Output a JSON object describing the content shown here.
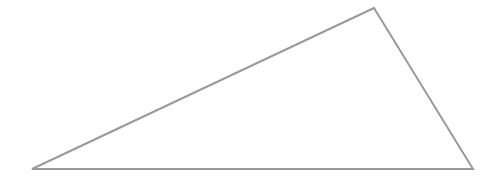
{
  "diagram": {
    "shape": "triangle",
    "vertices": [
      {
        "name": "top",
        "x": 374,
        "y": 8
      },
      {
        "name": "bottom-left",
        "x": 32,
        "y": 169
      },
      {
        "name": "bottom-right",
        "x": 473,
        "y": 169
      }
    ],
    "stroke_color": "#9a9a9a",
    "stroke_width": 2,
    "fill_color": "#ffffff",
    "background_color": "#ffffff"
  }
}
